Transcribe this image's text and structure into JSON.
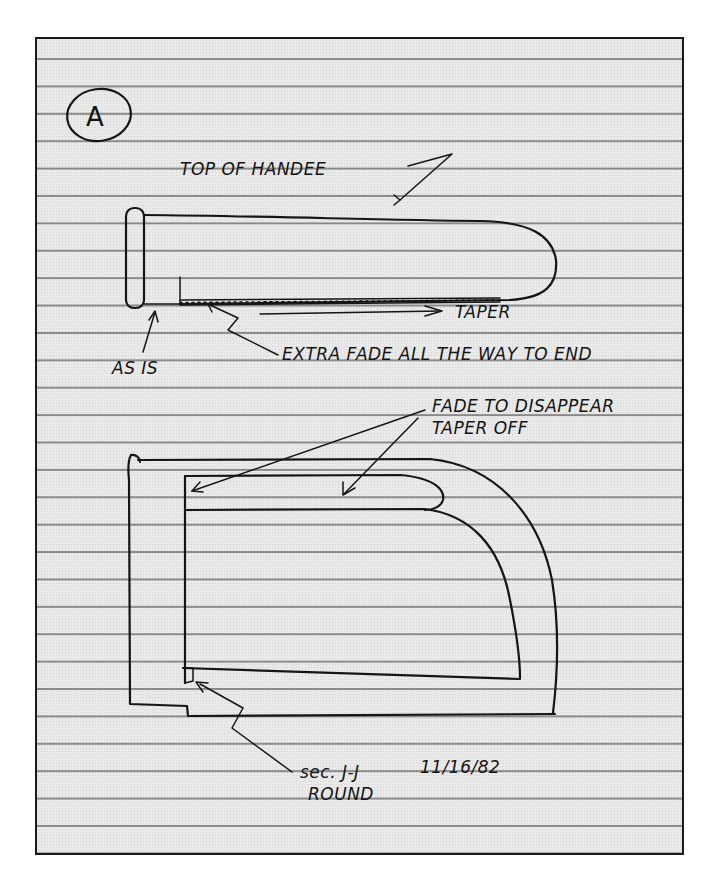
{
  "document": {
    "type": "handwritten sketch on ruled paper",
    "section_marker": "A",
    "colors": {
      "paper": "#e9e9e9",
      "ink": "#151515",
      "rule_lines": "#8a8a8a",
      "border": "#1a1a1a"
    }
  },
  "top_view": {
    "title": "TOP OF HANDLE",
    "title_as_written": "TOP OF HANDEE",
    "annotations": {
      "taper": "TAPER",
      "as_is": "AS IS",
      "extra_fade": "EXTRA FADE ALL THE WAY TO END"
    }
  },
  "side_view": {
    "annotations": {
      "fade_line1": "FADE TO DISAPPEAR",
      "fade_line2": "TAPER OFF",
      "section": "sec. J-J",
      "date": "11/16/82",
      "round": "ROUND"
    }
  }
}
